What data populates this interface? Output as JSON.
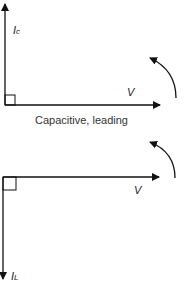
{
  "top": {
    "current_label": "I",
    "current_sub": "c",
    "voltage_label": "V",
    "caption": "Capacitive, leading"
  },
  "bottom": {
    "current_label": "I",
    "current_sub": "L",
    "voltage_label": "V"
  },
  "colors": {
    "line": "#111111"
  }
}
